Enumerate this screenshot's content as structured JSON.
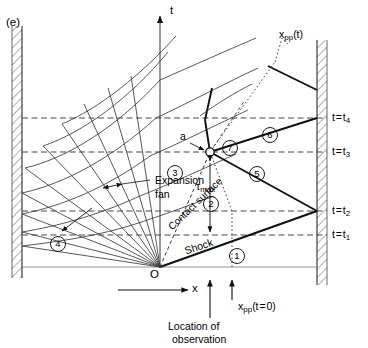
{
  "figure": {
    "panel_label": "(e)",
    "type": "x-t wave diagram",
    "axes": {
      "t_axis_label": "t",
      "x_axis_label": "x",
      "origin_label": "O"
    },
    "time_lines": [
      {
        "id": "t1",
        "label_prefix": "t = t",
        "label_sub": "1",
        "y": 235
      },
      {
        "id": "t2",
        "label_prefix": "t = t",
        "label_sub": "2",
        "y": 211
      },
      {
        "id": "t3",
        "label_prefix": "t = t",
        "label_sub": "3",
        "y": 152
      },
      {
        "id": "t4",
        "label_prefix": "t = t",
        "label_sub": "4",
        "y": 118
      }
    ],
    "regions": [
      {
        "number": "1",
        "x": 229,
        "y": 248
      },
      {
        "number": "2",
        "x": 203,
        "y": 196
      },
      {
        "number": "3",
        "x": 167,
        "y": 165
      },
      {
        "number": "4",
        "x": 50,
        "y": 236
      },
      {
        "number": "5",
        "x": 249,
        "y": 166
      },
      {
        "number": "6",
        "x": 262,
        "y": 127
      },
      {
        "number": "7",
        "x": 237,
        "y": 146
      }
    ],
    "annotations": {
      "expansion_fan": "Expansion\nfan",
      "expansion_fan_line1": "Expansion",
      "expansion_fan_line2": "fan",
      "contact_surface": "Contact surface",
      "shock": "Shock",
      "point_a": "a",
      "tau_max_symbol": "τ",
      "tau_max_sub": "max",
      "xpp_t_main": "x",
      "xpp_t_sub": "pp",
      "xpp_t_arg": "(t)",
      "xpp_t0_main": "x",
      "xpp_t0_sub": "pp",
      "xpp_t0_arg": "(t = 0)",
      "location_of_observation_line1": "Location of",
      "location_of_observation_line2": "observation"
    },
    "colors": {
      "ink": "#1a1a1a",
      "line": "#2a2a2a",
      "thin": "#555555",
      "dashed": "#333333",
      "background": "#ffffff"
    }
  }
}
